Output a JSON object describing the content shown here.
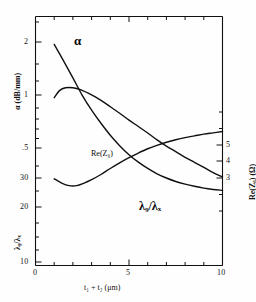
{
  "figure": {
    "background_color": "#fefefe",
    "line_color": "#101010",
    "frame_color": "#101010"
  },
  "chart_data": {
    "type": "line",
    "title": "",
    "subtitle": "",
    "xlabel": "t₁ + t₂   (μm)",
    "xlabel_plain": "t1 + t2 (um)",
    "xlim": [
      0,
      10
    ],
    "xticks_major": [
      0,
      5,
      10
    ],
    "xtick_labels": [
      "0",
      "5",
      "10"
    ],
    "xticks_minor": [
      1,
      2,
      3,
      4,
      6,
      7,
      8,
      9
    ],
    "grid": false,
    "legend": "inline-curve-labels",
    "axes": [
      {
        "id": "alpha-axis",
        "side": "left",
        "label": "α (dB/mm)",
        "label_plain": "alpha (dB/mm)",
        "scale": "log",
        "lim": [
          0.42,
          2.6
        ],
        "ticks": [
          2,
          1,
          0.5
        ],
        "tick_labels": [
          "2",
          "1",
          ".5"
        ]
      },
      {
        "id": "lambda-axis",
        "side": "left",
        "label": "λ₉/λₓ",
        "label_plain": "lambda_g / lambda_x",
        "scale": "log",
        "lim": [
          9,
          40
        ],
        "ticks": [
          30,
          20,
          10
        ],
        "tick_labels": [
          "30",
          "20",
          "10"
        ]
      },
      {
        "id": "impedance-axis",
        "side": "right",
        "label": "Re(Z₀)  (Ω)",
        "label_plain": "Re(Z0) (Ohm)",
        "scale": "linear",
        "lim": [
          1.6,
          7.4
        ],
        "ticks": [
          5,
          4,
          3
        ],
        "tick_labels": [
          "5",
          "4",
          "3"
        ]
      }
    ],
    "series": [
      {
        "name": "α",
        "name_plain": "alpha",
        "axis": "alpha-axis",
        "unit": "dB/mm",
        "label_text": "α",
        "x": [
          1.0,
          1.5,
          2.0,
          2.5,
          3.0,
          3.5,
          4.0,
          4.5,
          5.0,
          5.5,
          6.0,
          6.5,
          7.0,
          7.5,
          8.0,
          8.5,
          9.0,
          9.5,
          10.0
        ],
        "values": [
          2.12,
          1.88,
          1.66,
          1.46,
          1.31,
          1.19,
          1.09,
          1.01,
          0.945,
          0.895,
          0.855,
          0.822,
          0.797,
          0.777,
          0.762,
          0.75,
          0.74,
          0.733,
          0.728
        ]
      },
      {
        "name": "Re(Z₀)",
        "name_plain": "Re(Z0)",
        "axis": "impedance-axis",
        "unit": "Ω",
        "label_text": "Re(Z₀)",
        "x": [
          1.0,
          1.4,
          1.8,
          2.2,
          2.6,
          3.0,
          3.5,
          4.0,
          4.5,
          5.0,
          5.5,
          6.0,
          6.5,
          7.0,
          7.5,
          8.0,
          8.5,
          9.0,
          9.5,
          10.0
        ],
        "values": [
          3.62,
          3.52,
          3.46,
          3.46,
          3.52,
          3.6,
          3.72,
          3.86,
          3.99,
          4.11,
          4.22,
          4.32,
          4.4,
          4.47,
          4.53,
          4.58,
          4.62,
          4.66,
          4.69,
          4.72
        ]
      },
      {
        "name": "λ₉/λₓ",
        "name_plain": "lambda_g/lambda_x",
        "axis": "lambda-axis",
        "unit": "",
        "label_text": "λ₉/λₓ",
        "x": [
          1.0,
          1.3,
          1.6,
          2.0,
          2.4,
          3.0,
          3.5,
          4.0,
          4.5,
          5.0,
          5.5,
          6.0,
          6.5,
          7.0,
          7.5,
          8.0,
          8.5,
          9.0,
          9.5,
          10.0
        ],
        "values": [
          24.6,
          25.7,
          26.1,
          26.1,
          25.8,
          25.0,
          24.2,
          23.3,
          22.4,
          21.5,
          20.7,
          19.9,
          19.1,
          18.4,
          17.8,
          17.2,
          16.7,
          16.2,
          15.7,
          15.3
        ]
      }
    ],
    "annotations": [
      {
        "id": "alpha-curve-label",
        "text": "α",
        "x": 1.9,
        "y_px": 42
      },
      {
        "id": "rez-curve-label",
        "text": "Re(Z₀)",
        "x": 3.4,
        "y_px": 155
      },
      {
        "id": "lambda-curve-label",
        "text": "λ₉/λₓ",
        "x": 6.5,
        "y_px": 209
      }
    ]
  }
}
